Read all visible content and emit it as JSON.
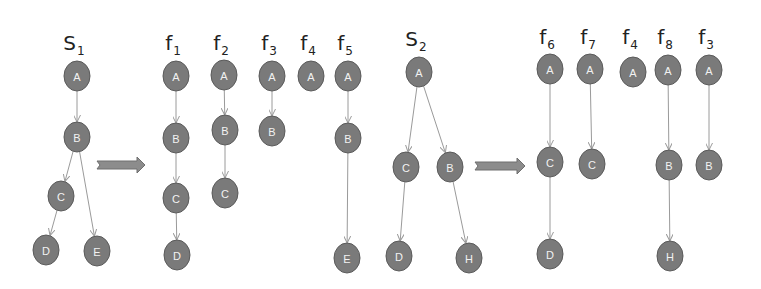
{
  "diagram": {
    "colors": {
      "node_fill": "#7a7a7a",
      "node_stroke": "#5a5a5a",
      "node_text": "#f2f2f2",
      "edge": "#9a9a9a",
      "label": "#222222",
      "arrow": "#8c8c8c"
    },
    "groups": [
      {
        "id": "S1",
        "label_main": "S",
        "label_sub": "1",
        "label_x": 77,
        "label_y": 50,
        "nodes": [
          {
            "id": "s1A",
            "label": "A",
            "x": 77,
            "y": 76
          },
          {
            "id": "s1B",
            "label": "B",
            "x": 77,
            "y": 137
          },
          {
            "id": "s1C",
            "label": "C",
            "x": 61,
            "y": 196
          },
          {
            "id": "s1D",
            "label": "D",
            "x": 46,
            "y": 250
          },
          {
            "id": "s1E",
            "label": "E",
            "x": 97,
            "y": 251
          }
        ],
        "edges": [
          [
            "s1A",
            "s1B"
          ],
          [
            "s1B",
            "s1C"
          ],
          [
            "s1B",
            "s1E"
          ],
          [
            "s1C",
            "s1D"
          ]
        ]
      },
      {
        "id": "f1",
        "label_main": "f",
        "label_sub": "1",
        "label_x": 176,
        "label_y": 50,
        "nodes": [
          {
            "id": "f1A",
            "label": "A",
            "x": 176,
            "y": 76
          },
          {
            "id": "f1B",
            "label": "B",
            "x": 176,
            "y": 138
          },
          {
            "id": "f1C",
            "label": "C",
            "x": 176,
            "y": 198
          },
          {
            "id": "f1D",
            "label": "D",
            "x": 177,
            "y": 255
          }
        ],
        "edges": [
          [
            "f1A",
            "f1B"
          ],
          [
            "f1B",
            "f1C"
          ],
          [
            "f1C",
            "f1D"
          ]
        ]
      },
      {
        "id": "f2",
        "label_main": "f",
        "label_sub": "2",
        "label_x": 224,
        "label_y": 50,
        "nodes": [
          {
            "id": "f2A",
            "label": "A",
            "x": 224,
            "y": 75
          },
          {
            "id": "f2B",
            "label": "B",
            "x": 225,
            "y": 130
          },
          {
            "id": "f2C",
            "label": "C",
            "x": 225,
            "y": 193
          }
        ],
        "edges": [
          [
            "f2A",
            "f2B"
          ],
          [
            "f2B",
            "f2C"
          ]
        ]
      },
      {
        "id": "f3",
        "label_main": "f",
        "label_sub": "3",
        "label_x": 272,
        "label_y": 50,
        "nodes": [
          {
            "id": "f3A",
            "label": "A",
            "x": 272,
            "y": 76
          },
          {
            "id": "f3B",
            "label": "B",
            "x": 272,
            "y": 131
          }
        ],
        "edges": [
          [
            "f3A",
            "f3B"
          ]
        ]
      },
      {
        "id": "f4",
        "label_main": "f",
        "label_sub": "4",
        "label_x": 311,
        "label_y": 50,
        "nodes": [
          {
            "id": "f4A",
            "label": "A",
            "x": 311,
            "y": 76
          }
        ],
        "edges": []
      },
      {
        "id": "f5",
        "label_main": "f",
        "label_sub": "5",
        "label_x": 348,
        "label_y": 50,
        "nodes": [
          {
            "id": "f5A",
            "label": "A",
            "x": 348,
            "y": 76
          },
          {
            "id": "f5B",
            "label": "B",
            "x": 348,
            "y": 138
          },
          {
            "id": "f5E",
            "label": "E",
            "x": 347,
            "y": 258
          }
        ],
        "edges": [
          [
            "f5A",
            "f5B"
          ],
          [
            "f5B",
            "f5E"
          ]
        ]
      },
      {
        "id": "S2",
        "label_main": "S",
        "label_sub": "2",
        "label_x": 419,
        "label_y": 46,
        "nodes": [
          {
            "id": "s2A",
            "label": "A",
            "x": 419,
            "y": 72
          },
          {
            "id": "s2C",
            "label": "C",
            "x": 406,
            "y": 167
          },
          {
            "id": "s2B",
            "label": "B",
            "x": 450,
            "y": 167
          },
          {
            "id": "s2D",
            "label": "D",
            "x": 399,
            "y": 256
          },
          {
            "id": "s2H",
            "label": "H",
            "x": 469,
            "y": 258
          }
        ],
        "edges": [
          [
            "s2A",
            "s2C"
          ],
          [
            "s2A",
            "s2B"
          ],
          [
            "s2C",
            "s2D"
          ],
          [
            "s2B",
            "s2H"
          ]
        ]
      },
      {
        "id": "f6",
        "label_main": "f",
        "label_sub": "6",
        "label_x": 550,
        "label_y": 44,
        "nodes": [
          {
            "id": "f6A",
            "label": "A",
            "x": 550,
            "y": 69
          },
          {
            "id": "f6C",
            "label": "C",
            "x": 550,
            "y": 162
          },
          {
            "id": "f6D",
            "label": "D",
            "x": 550,
            "y": 254
          }
        ],
        "edges": [
          [
            "f6A",
            "f6C"
          ],
          [
            "f6C",
            "f6D"
          ]
        ]
      },
      {
        "id": "f7",
        "label_main": "f",
        "label_sub": "7",
        "label_x": 591,
        "label_y": 44,
        "nodes": [
          {
            "id": "f7A",
            "label": "A",
            "x": 590,
            "y": 69
          },
          {
            "id": "f7C",
            "label": "C",
            "x": 592,
            "y": 164
          }
        ],
        "edges": [
          [
            "f7A",
            "f7C"
          ]
        ]
      },
      {
        "id": "f4b",
        "label_main": "f",
        "label_sub": "4",
        "label_x": 633,
        "label_y": 44,
        "nodes": [
          {
            "id": "f4bA",
            "label": "A",
            "x": 633,
            "y": 72
          }
        ],
        "edges": []
      },
      {
        "id": "f8",
        "label_main": "f",
        "label_sub": "8",
        "label_x": 668,
        "label_y": 44,
        "nodes": [
          {
            "id": "f8A",
            "label": "A",
            "x": 668,
            "y": 70
          },
          {
            "id": "f8B",
            "label": "B",
            "x": 669,
            "y": 165
          },
          {
            "id": "f8H",
            "label": "H",
            "x": 670,
            "y": 256
          }
        ],
        "edges": [
          [
            "f8A",
            "f8B"
          ],
          [
            "f8B",
            "f8H"
          ]
        ]
      },
      {
        "id": "f3b",
        "label_main": "f",
        "label_sub": "3",
        "label_x": 709,
        "label_y": 44,
        "nodes": [
          {
            "id": "f3bA",
            "label": "A",
            "x": 709,
            "y": 70
          },
          {
            "id": "f3bB",
            "label": "B",
            "x": 709,
            "y": 165
          }
        ],
        "edges": [
          [
            "f3bA",
            "f3bB"
          ]
        ]
      }
    ],
    "block_arrows": [
      {
        "id": "arrow-1",
        "x1": 97,
        "x2": 145,
        "y": 165
      },
      {
        "id": "arrow-2",
        "x1": 475,
        "x2": 525,
        "y": 166
      }
    ]
  }
}
